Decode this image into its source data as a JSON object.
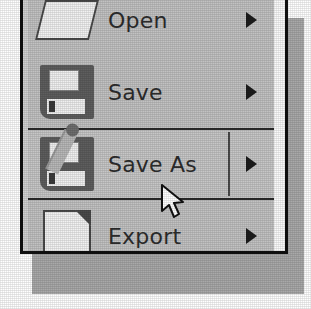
{
  "window": {
    "kind": "cascading-menu",
    "background_color": "#c2c2c2",
    "border_color": "#111111",
    "shadow_color": "#a9a9a9",
    "text_color": "#2d2d2d"
  },
  "menu": {
    "items": [
      {
        "label": "Open",
        "icon": "folder-open-icon",
        "has_submenu": true,
        "submenu_marker": "right-triangle",
        "selected": false,
        "clipped": "top"
      },
      {
        "label": "Save",
        "icon": "floppy-disk-icon",
        "has_submenu": true,
        "submenu_marker": "right-triangle",
        "selected": false,
        "clipped": "none"
      },
      {
        "label": "Save As",
        "icon": "floppy-disk-pencil-icon",
        "has_submenu": true,
        "submenu_marker": "right-triangle",
        "selected": true,
        "clipped": "none"
      },
      {
        "label": "Export",
        "icon": "document-page-icon",
        "has_submenu": true,
        "submenu_marker": "right-triangle",
        "selected": false,
        "clipped": "bottom"
      }
    ],
    "selected_index": 2,
    "highlight_border_color": "#2b2b2b"
  },
  "cursor": {
    "icon": "mouse-pointer-icon",
    "over_item": "Save As",
    "x": 160,
    "y": 184
  }
}
